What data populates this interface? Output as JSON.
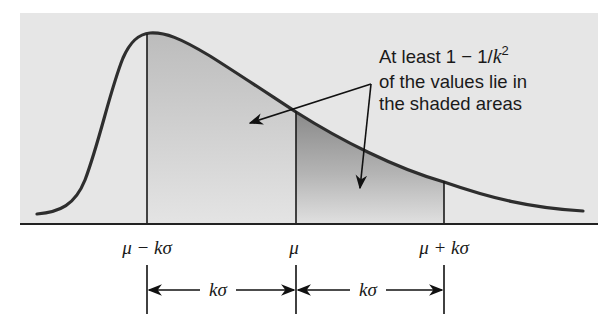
{
  "figure": {
    "type": "chebyshev-skewed-distribution-diagram",
    "colors": {
      "panel_background": "#e6e6e6",
      "shade_left_top": "#bdbdbd",
      "shade_left_bottom": "#e2e2e2",
      "shade_right_top": "#8f8f8f",
      "shade_right_bottom": "#dedede",
      "curve": "#2e2e2e",
      "lines": "#1a1a1a"
    },
    "annotation": {
      "line1_prefix": "At least 1 − 1/",
      "line1_var": "k",
      "line1_exp": "2",
      "line2": "of the values lie in",
      "line3": "the shaded areas"
    },
    "axis_labels": {
      "left": "μ − kσ",
      "center": "μ",
      "right": "μ + kσ"
    },
    "intervals": {
      "left": "kσ",
      "right": "kσ"
    },
    "shaded_regions": [
      "μ − kσ to μ",
      "μ to μ + kσ"
    ]
  }
}
